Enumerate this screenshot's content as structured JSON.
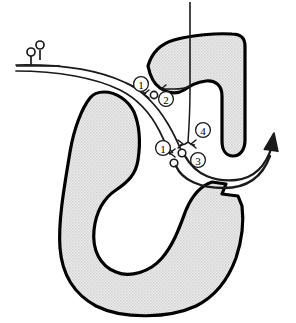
{
  "figure": {
    "background_color": "#ffffff",
    "outline_color": "#000000",
    "fill_color": "#e2e2e2",
    "stipple_dot_color": "#b4b4b4",
    "line_color": "#1a1a1a"
  },
  "structures": [
    {
      "id": "structure-left",
      "name": "large-c-shaped-structure",
      "fill": "#e2e2e2",
      "stroke": "#000000",
      "stroke_width": 3.2
    },
    {
      "id": "structure-upper-right",
      "name": "upper-right-hook-structure",
      "fill": "#e2e2e2",
      "stroke": "#000000",
      "stroke_width": 3.2
    }
  ],
  "labels": [
    {
      "id": "label-1-upper",
      "text": "①",
      "value": "1",
      "x": 141,
      "y": 84
    },
    {
      "id": "label-2",
      "text": "②",
      "value": "2",
      "x": 166,
      "y": 99
    },
    {
      "id": "label-1-lower",
      "text": "①",
      "value": "1",
      "x": 163,
      "y": 148
    },
    {
      "id": "label-3",
      "text": "③",
      "value": "3",
      "x": 198,
      "y": 160
    },
    {
      "id": "label-4",
      "text": "④",
      "value": "4",
      "x": 203,
      "y": 130
    }
  ],
  "terminals": {
    "bouton_circles": [
      {
        "id": "bouton-top-left-a",
        "x": 31,
        "y": 60,
        "r": 4.0
      },
      {
        "id": "bouton-top-left-b",
        "x": 40,
        "y": 52,
        "r": 4.0
      },
      {
        "id": "bouton-mid-a",
        "x": 154,
        "y": 94,
        "r": 3.6
      },
      {
        "id": "bouton-lower-a",
        "x": 182,
        "y": 153,
        "r": 3.8
      },
      {
        "id": "bouton-lower-b",
        "x": 174,
        "y": 162,
        "r": 3.8
      }
    ],
    "arrow_terminals": [
      {
        "id": "arrowhead-upper-1",
        "x": 145,
        "y": 93
      },
      {
        "id": "arrowhead-hook",
        "x": 166,
        "y": 89
      },
      {
        "id": "arrowhead-lower-1",
        "x": 171,
        "y": 153
      },
      {
        "id": "arrowhead-lower-2",
        "x": 181,
        "y": 144
      },
      {
        "id": "arrowhead-lower-3",
        "x": 192,
        "y": 143
      }
    ]
  },
  "pathways": [
    {
      "id": "afferent-pathway",
      "name": "afferent-fiber-bundle-from-upper-left",
      "stroke": "#1a1a1a",
      "stroke_width": 1.7
    },
    {
      "id": "descending-pathway",
      "name": "vertical-descending-fiber",
      "stroke": "#1a1a1a",
      "stroke_width": 1.5
    },
    {
      "id": "efferent-pathway",
      "name": "efferent-output-arrow-to-upper-right",
      "stroke": "#1a1a1a",
      "stroke_width": 2.6
    }
  ],
  "arrows": [
    {
      "id": "output-arrow",
      "name": "output-arrowhead-upper-right",
      "x": 272,
      "y": 131,
      "direction": "up-right"
    }
  ]
}
